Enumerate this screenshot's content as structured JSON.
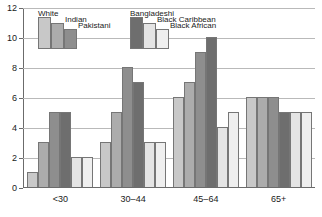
{
  "chart_data": {
    "type": "bar",
    "title": "",
    "xlabel": "",
    "ylabel": "",
    "ylim": [
      0,
      12
    ],
    "ytick_labels": [
      "0",
      "2",
      "4",
      "6",
      "8",
      "10",
      "12"
    ],
    "ytick_values": [
      0,
      2,
      4,
      6,
      8,
      10,
      12
    ],
    "grid": true,
    "legend_position": "upper-left-inside",
    "categories": [
      "<30",
      "30–44",
      "45–64",
      "65+"
    ],
    "series": [
      {
        "name": "White",
        "color": "#c8c8c8",
        "values": [
          1,
          3,
          6,
          6
        ]
      },
      {
        "name": "Indian",
        "color": "#acacac",
        "values": [
          3,
          5,
          7,
          6
        ]
      },
      {
        "name": "Pakistani",
        "color": "#8e8e8e",
        "values": [
          5,
          8,
          9,
          6
        ]
      },
      {
        "name": "Bangladeshi",
        "color": "#6e6e6e",
        "values": [
          5,
          7,
          10,
          5
        ]
      },
      {
        "name": "Black Caribbean",
        "color": "#e4e4e4",
        "values": [
          2,
          3,
          4,
          5
        ]
      },
      {
        "name": "Black African",
        "color": "#efefef",
        "values": [
          2,
          3,
          5,
          5
        ]
      }
    ]
  },
  "legend": {
    "group_a": [
      {
        "label": "White",
        "color": "#c8c8c8"
      },
      {
        "label": "Indian",
        "color": "#acacac"
      },
      {
        "label": "Pakistani",
        "color": "#8e8e8e"
      }
    ],
    "group_b": [
      {
        "label": "Bangladeshi",
        "color": "#6e6e6e"
      },
      {
        "label": "Black Caribbean",
        "color": "#e4e4e4"
      },
      {
        "label": "Black African",
        "color": "#efefef"
      }
    ]
  },
  "colors": {
    "axis": "#6b6b6b",
    "grid": "#b9b9b9",
    "bar_outline": "#767676",
    "text": "#1a1a1a",
    "background": "#ffffff"
  }
}
